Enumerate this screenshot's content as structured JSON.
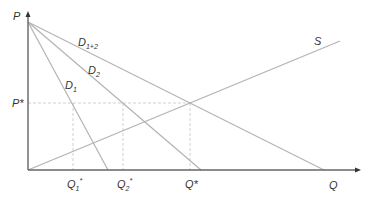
{
  "diagram": {
    "type": "supply-demand",
    "colors": {
      "axis": "#666666",
      "curve": "#b3b3b3",
      "dashed": "#bdbdbd",
      "text": "#333333"
    },
    "axes": {
      "y_label": "P",
      "x_label": "Q"
    },
    "curves": [
      {
        "id": "D1",
        "label": "D",
        "sub": "1"
      },
      {
        "id": "D2",
        "label": "D",
        "sub": "2"
      },
      {
        "id": "D1+2",
        "label": "D",
        "sub": "1+2"
      },
      {
        "id": "S",
        "label": "S",
        "sub": ""
      }
    ],
    "price_marker": {
      "label": "P*"
    },
    "quantity_markers": [
      {
        "label": "Q",
        "sub": "1",
        "star": "*"
      },
      {
        "label": "Q",
        "sub": "2",
        "star": "*"
      },
      {
        "label": "Q*",
        "sub": "",
        "star": ""
      }
    ]
  }
}
